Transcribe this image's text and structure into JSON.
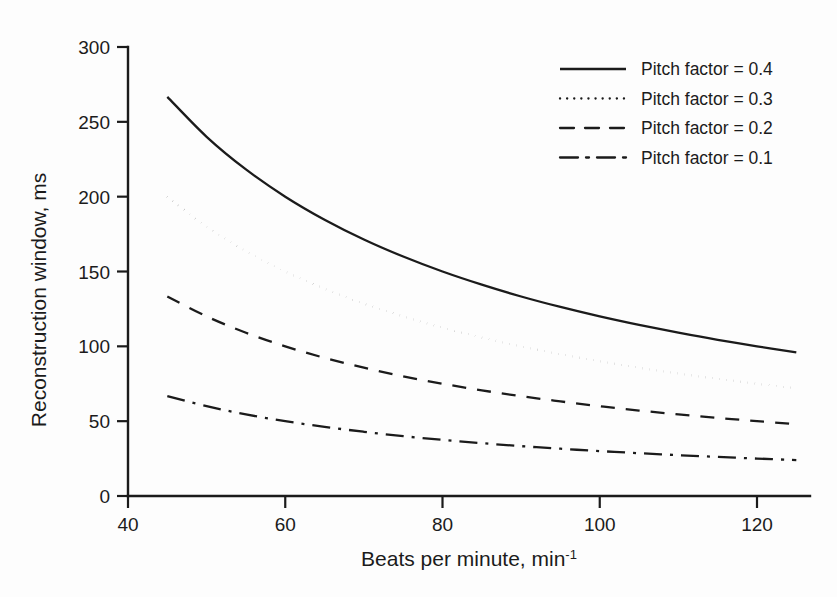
{
  "chart_data": {
    "type": "line",
    "title": "",
    "xlabel": "Beats per minute, min",
    "xlabel_sup": "-1",
    "ylabel": "Reconstruction window, ms",
    "xlim": [
      40,
      128
    ],
    "ylim": [
      0,
      300
    ],
    "xticks": [
      40,
      60,
      80,
      100,
      120
    ],
    "yticks": [
      0,
      50,
      100,
      150,
      200,
      250,
      300
    ],
    "xtick_labels": [
      "40",
      "60",
      "80",
      "100",
      "120"
    ],
    "ytick_labels": [
      "0",
      "50",
      "100",
      "150",
      "200",
      "250",
      "300"
    ],
    "grid": false,
    "legend_position": "top-right",
    "x": [
      45,
      50,
      55,
      60,
      65,
      70,
      75,
      80,
      85,
      90,
      95,
      100,
      105,
      110,
      115,
      120,
      125
    ],
    "series": [
      {
        "name": "Pitch factor = 0.4",
        "pitch_factor": 0.4,
        "style": "solid",
        "values": [
          266.7,
          240.0,
          218.2,
          200.0,
          184.6,
          171.4,
          160.0,
          150.0,
          141.2,
          133.3,
          126.3,
          120.0,
          114.3,
          109.1,
          104.3,
          100.0,
          96.0
        ]
      },
      {
        "name": "Pitch factor = 0.3",
        "pitch_factor": 0.3,
        "style": "dotted",
        "values": [
          200.0,
          180.0,
          163.6,
          150.0,
          138.5,
          128.6,
          120.0,
          112.5,
          105.9,
          100.0,
          94.7,
          90.0,
          85.7,
          81.8,
          78.3,
          75.0,
          72.0
        ]
      },
      {
        "name": "Pitch factor = 0.2",
        "pitch_factor": 0.2,
        "style": "dashed",
        "values": [
          133.3,
          120.0,
          109.1,
          100.0,
          92.3,
          85.7,
          80.0,
          75.0,
          70.6,
          66.7,
          63.2,
          60.0,
          57.1,
          54.5,
          52.2,
          50.0,
          48.0
        ]
      },
      {
        "name": "Pitch factor = 0.1",
        "pitch_factor": 0.1,
        "style": "dash-dot",
        "values": [
          66.7,
          60.0,
          54.5,
          50.0,
          46.2,
          42.9,
          40.0,
          37.5,
          35.3,
          33.3,
          31.6,
          30.0,
          28.6,
          27.3,
          26.1,
          25.0,
          24.0
        ]
      }
    ],
    "formula_note": "reconstruction window = 30000 x pitch factor / bpm",
    "line_color": "#1b1b1b",
    "background_color": "#fdfdfd"
  },
  "legend": {
    "entries": [
      {
        "label": "Pitch factor = 0.4",
        "style": "solid"
      },
      {
        "label": "Pitch factor = 0.3",
        "style": "dotted"
      },
      {
        "label": "Pitch factor = 0.2",
        "style": "dashed"
      },
      {
        "label": "Pitch factor = 0.1",
        "style": "dash-dot"
      }
    ]
  }
}
